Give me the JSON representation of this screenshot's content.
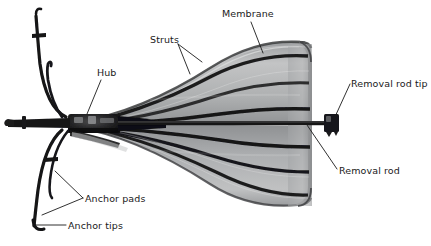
{
  "figure": {
    "kind": "annotated-photograph",
    "background_color": "#ffffff",
    "width": 431,
    "height": 246
  },
  "labels": [
    {
      "id": "membrane",
      "text": "Membrane",
      "x": 222,
      "y": 8
    },
    {
      "id": "struts",
      "text": "Struts",
      "x": 150,
      "y": 34
    },
    {
      "id": "hub",
      "text": "Hub",
      "x": 97,
      "y": 67
    },
    {
      "id": "removal_rod_tip",
      "text": "Removal rod tip",
      "x": 351,
      "y": 78
    },
    {
      "id": "removal_rod",
      "text": "Removal rod",
      "x": 339,
      "y": 165
    },
    {
      "id": "anchor_pads",
      "text": "Anchor pads",
      "x": 85,
      "y": 193
    },
    {
      "id": "anchor_tips",
      "text": "Anchor tips",
      "x": 68,
      "y": 220
    }
  ],
  "leader_lines": [
    {
      "for": "membrane",
      "from": [
        251,
        22
      ],
      "to": [
        263,
        53
      ]
    },
    {
      "for": "struts",
      "from": [
        178,
        44
      ],
      "to": [
        200,
        62
      ]
    },
    {
      "for": "struts",
      "from": [
        178,
        44
      ],
      "to": [
        188,
        73
      ]
    },
    {
      "for": "hub",
      "from": [
        100,
        80
      ],
      "to": [
        86,
        114
      ]
    },
    {
      "for": "removal_rod_tip",
      "from": [
        350,
        84
      ],
      "to": [
        334,
        121
      ]
    },
    {
      "for": "removal_rod",
      "from": [
        337,
        169
      ],
      "to": [
        308,
        125
      ]
    },
    {
      "for": "anchor_pads",
      "from": [
        83,
        198
      ],
      "to": [
        56,
        173
      ]
    },
    {
      "for": "anchor_pads",
      "from": [
        83,
        198
      ],
      "to": [
        42,
        214
      ]
    },
    {
      "for": "anchor_tips",
      "from": [
        66,
        225
      ],
      "to": [
        33,
        225
      ]
    }
  ],
  "colors": {
    "label_text": "#1a1a1a",
    "leader_line": "#1a1a1a",
    "device_dark": "#161616",
    "device_mid": "#6f7072",
    "device_light": "#c9cacb",
    "membrane_fill": "#a8aaac",
    "background": "#ffffff"
  },
  "device_parts": [
    {
      "name": "membrane",
      "description": "large translucent gray fan spreading to the right"
    },
    {
      "name": "struts",
      "description": "dark radial ribs fanning out from the hub across the membrane"
    },
    {
      "name": "hub",
      "description": "dark central cylindrical collar where struts and anchors converge"
    },
    {
      "name": "anchor_pads",
      "description": "small T-shaped pads on the curved left anchor wires"
    },
    {
      "name": "anchor_tips",
      "description": "curved ends of the anchor wires at the far left"
    },
    {
      "name": "removal_rod",
      "description": "thin straight rod extending right from the hub through the membrane"
    },
    {
      "name": "removal_rod_tip",
      "description": "dark cubic fitting at the right end of the removal rod"
    }
  ]
}
